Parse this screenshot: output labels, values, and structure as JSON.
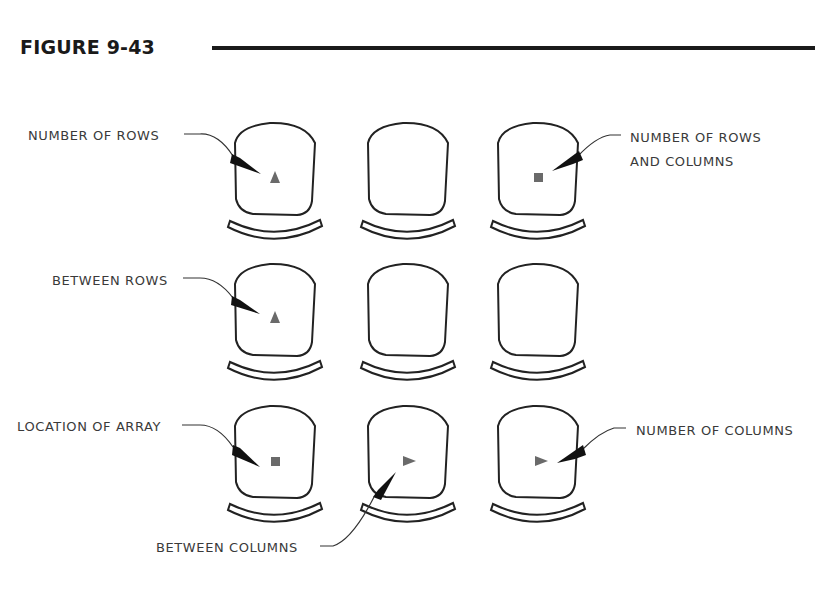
{
  "figure": {
    "title": "FIGURE 9-43"
  },
  "labels": {
    "number_of_rows": "NUMBER OF ROWS",
    "number_of_rows_and_columns_line1": "NUMBER OF ROWS",
    "number_of_rows_and_columns_line2": "AND COLUMNS",
    "between_rows": "BETWEEN ROWS",
    "location_of_array": "LOCATION OF ARRAY",
    "number_of_columns": "NUMBER OF COLUMNS",
    "between_columns": "BETWEEN COLUMNS"
  },
  "grid": {
    "rows": 3,
    "columns": 3,
    "markers": [
      {
        "row": 1,
        "col": 1,
        "shape": "triangle-up"
      },
      {
        "row": 1,
        "col": 3,
        "shape": "square"
      },
      {
        "row": 2,
        "col": 1,
        "shape": "triangle-up"
      },
      {
        "row": 3,
        "col": 1,
        "shape": "square"
      },
      {
        "row": 3,
        "col": 2,
        "shape": "triangle-right"
      },
      {
        "row": 3,
        "col": 3,
        "shape": "triangle-right"
      }
    ]
  },
  "colors": {
    "line": "#222222",
    "marker": "#6a6a6a",
    "text": "#3a3a3a"
  }
}
